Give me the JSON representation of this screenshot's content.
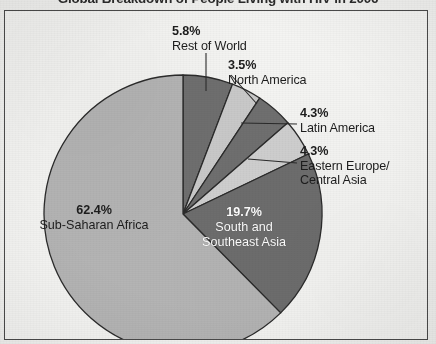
{
  "title": "Global Breakdown of People Living with HIV in 2006",
  "frame": {
    "border_color": "#4a4a4a",
    "background_color": "#f4f4f2"
  },
  "chart_data": {
    "type": "pie",
    "title": "Global Breakdown of People Living with HIV in 2006",
    "xlabel": "",
    "ylabel": "",
    "legend_position": "none",
    "grid": false,
    "units": "percent",
    "start_angle_deg": 0,
    "direction": "clockwise",
    "categories": [
      "Rest of World",
      "North America",
      "Latin America",
      "Eastern Europe/\nCentral Asia",
      "South and\nSoutheast Asia",
      "Sub-Saharan Africa"
    ],
    "values": [
      5.8,
      3.5,
      4.3,
      4.3,
      19.7,
      62.4
    ],
    "labels": [
      "5.8%",
      "3.5%",
      "4.3%",
      "4.3%",
      "19.7%",
      "62.4%"
    ],
    "colors": [
      "#6f6f6f",
      "#c9c9c9",
      "#6f6f6f",
      "#cfcfcf",
      "#6d6d6d",
      "#b4b4b4"
    ],
    "slices": [
      {
        "name": "Rest of World",
        "value": 5.8,
        "pct_label": "5.8%",
        "name_label": "Rest of World",
        "color": "#6f6f6f",
        "label_placement": "outside-callout",
        "text_color": "#1d1d1d"
      },
      {
        "name": "North America",
        "value": 3.5,
        "pct_label": "3.5%",
        "name_label": "North America",
        "color": "#c9c9c9",
        "label_placement": "outside-callout",
        "text_color": "#1d1d1d"
      },
      {
        "name": "Latin America",
        "value": 4.3,
        "pct_label": "4.3%",
        "name_label": "Latin America",
        "color": "#6f6f6f",
        "label_placement": "outside-callout",
        "text_color": "#1d1d1d"
      },
      {
        "name": "Eastern Europe/Central Asia",
        "value": 4.3,
        "pct_label": "4.3%",
        "name_label": "Eastern Europe/\nCentral Asia",
        "color": "#cfcfcf",
        "label_placement": "outside-callout",
        "text_color": "#1d1d1d"
      },
      {
        "name": "South and Southeast Asia",
        "value": 19.7,
        "pct_label": "19.7%",
        "name_label": "South and\nSoutheast Asia",
        "color": "#6d6d6d",
        "label_placement": "inside",
        "text_color": "#ffffff"
      },
      {
        "name": "Sub-Saharan Africa",
        "value": 62.4,
        "pct_label": "62.4%",
        "name_label": "Sub-Saharan Africa",
        "color": "#b4b4b4",
        "label_placement": "inside",
        "text_color": "#1d1d1d"
      }
    ],
    "total": 100.0
  }
}
